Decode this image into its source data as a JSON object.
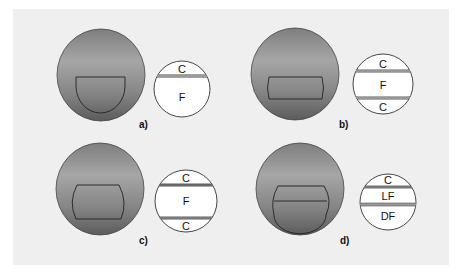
{
  "figure": {
    "background_color": "#efefef",
    "panels": [
      {
        "id": "a",
        "caption": "a)",
        "schematic_labels": [
          "C",
          "F"
        ]
      },
      {
        "id": "b",
        "caption": "b)",
        "schematic_labels": [
          "C",
          "F",
          "C"
        ]
      },
      {
        "id": "c",
        "caption": "c)",
        "schematic_labels": [
          "C",
          "F",
          "C"
        ]
      },
      {
        "id": "d",
        "caption": "d)",
        "schematic_labels": [
          "C",
          "LF",
          "DF"
        ]
      }
    ]
  }
}
